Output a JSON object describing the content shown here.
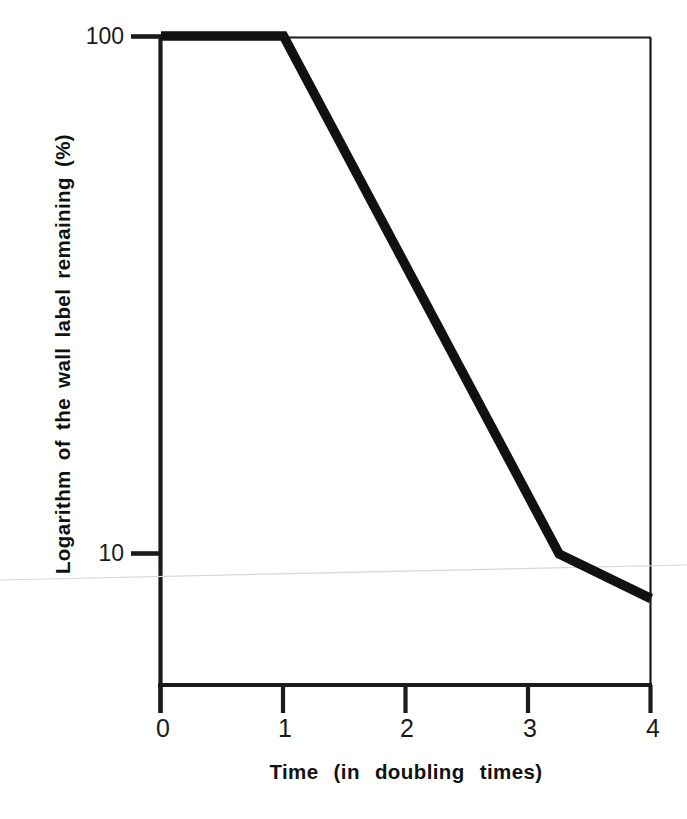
{
  "chart_data": {
    "type": "line",
    "title": "",
    "xlabel": "Time  (in  doubling  times)",
    "ylabel": "Logarithm of the wall label remaining (%)",
    "yscale": "log",
    "xscale": "linear",
    "xlim": [
      0,
      4
    ],
    "ylim": [
      7.6,
      100
    ],
    "grid": false,
    "legend": null,
    "x_ticks": [
      "0",
      "1",
      "2",
      "3",
      "4"
    ],
    "x_tick_values": [
      0,
      1,
      2,
      3,
      4
    ],
    "y_ticks": [
      "100",
      "10"
    ],
    "y_tick_values": [
      100,
      10
    ],
    "series": [
      {
        "name": "wall label remaining",
        "x": [
          0,
          1,
          3.25,
          4
        ],
        "values": [
          100,
          100,
          10,
          8.2
        ]
      }
    ],
    "annotations": [],
    "line_color": "#111111",
    "axis_color": "#1a1a1a",
    "background_color": "#ffffff"
  },
  "axis_titles": {
    "x": "Time  (in  doubling  times)",
    "y": "Logarithm of the wall label remaining (%)"
  },
  "tick_labels": {
    "y": [
      {
        "text": "100"
      },
      {
        "text": "10"
      }
    ],
    "x": [
      {
        "text": "0"
      },
      {
        "text": "1"
      },
      {
        "text": "2"
      },
      {
        "text": "3"
      },
      {
        "text": "4"
      }
    ]
  }
}
